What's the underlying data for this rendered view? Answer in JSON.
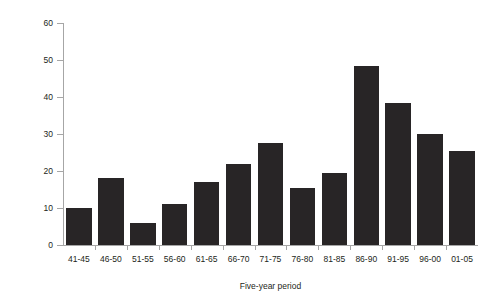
{
  "chart_data": {
    "type": "bar",
    "title": "",
    "subtitle": "",
    "xlabel": "Five-year period",
    "ylabel": "Number of birds",
    "categories": [
      "41-45",
      "46-50",
      "51-55",
      "56-60",
      "61-65",
      "66-70",
      "71-75",
      "76-80",
      "81-85",
      "86-90",
      "91-95",
      "96-00",
      "01-05"
    ],
    "values": [
      10,
      18,
      6,
      11,
      17,
      22,
      27.5,
      15.5,
      19.5,
      48.5,
      38.5,
      30,
      25.5
    ],
    "ylim": [
      0,
      60
    ],
    "yticks": [
      0,
      10,
      20,
      30,
      40,
      50,
      60
    ],
    "ytick_labels": [
      "0",
      "10",
      "20",
      "30",
      "40",
      "50",
      "60"
    ],
    "grid": false,
    "legend": null,
    "bar_color": "#282526",
    "axis_color": "#a6a6a6",
    "text_color": "#231f20",
    "annotations": []
  }
}
